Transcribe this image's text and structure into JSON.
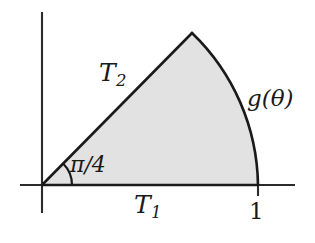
{
  "figure": {
    "type": "geometric-diagram",
    "background_color": "#ffffff",
    "fill_color": "#e2e2e2",
    "stroke_color": "#1a1a1a",
    "axis_color": "#2b2b2b"
  },
  "axes": {
    "x_axis": {
      "name": "horizontal-axis",
      "y": 185,
      "x_start": 20,
      "x_end": 295
    },
    "y_axis": {
      "name": "vertical-axis",
      "x": 42,
      "y_start": 12,
      "y_end": 213
    },
    "origin": {
      "x": 42,
      "y": 185
    }
  },
  "ticks": [
    {
      "label": "1",
      "x": 258,
      "y": 185,
      "axis": "x"
    }
  ],
  "region": {
    "apex": {
      "x": 192,
      "y": 33
    },
    "base_end": {
      "x": 258,
      "y": 185
    },
    "arc_radius": 215
  },
  "angle": {
    "label": "π/4",
    "value_radians": 0.7853981634,
    "arc_radius": 30,
    "vertex": {
      "x": 42,
      "y": 185
    }
  },
  "labels": {
    "straight_edge": {
      "base": "T",
      "subscript": "2",
      "full": "T₂"
    },
    "base_edge": {
      "base": "T",
      "subscript": "1",
      "full": "T₁"
    },
    "curve": {
      "full": "g(θ)",
      "function_name": "g",
      "argument": "θ"
    },
    "angle": {
      "full": "π/4"
    },
    "tick_one": {
      "full": "1"
    }
  }
}
